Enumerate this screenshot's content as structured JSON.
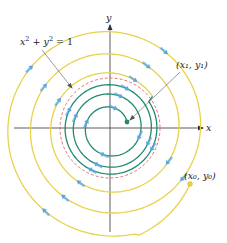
{
  "figure": {
    "labels": {
      "circle_equation": "x² + y² = 1",
      "circle_eq_parts": {
        "x": "x",
        "y": "y",
        "exp": "2",
        "rhs": "= 1",
        "plus": "+"
      },
      "end_point": "(x₁, y₁)",
      "start_point": "(x₀, y₀)",
      "x_axis": "x",
      "y_axis": "y"
    },
    "colors": {
      "outer_trajectory": "#e8d24a",
      "inner_trajectory": "#1f8a6e",
      "direction_arrows": "#5aa7e0",
      "unit_circle": "#d9534f",
      "axes": "#333333",
      "leader_lines": "#555555"
    },
    "geometry": {
      "origin": [
        110,
        128
      ],
      "unit_circle_radius": 50,
      "start_point": [
        190,
        184
      ],
      "end_point": [
        127,
        122
      ]
    }
  }
}
